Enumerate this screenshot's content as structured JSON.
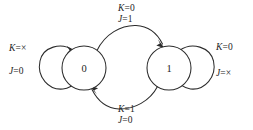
{
  "diagram": {
    "type": "state-transition-diagram",
    "title": "",
    "stroke_color": "#2b2b2b",
    "background_color": "#ffffff",
    "states": [
      {
        "id": "s0",
        "label": "0",
        "cx": 84,
        "cy": 68,
        "r": 22
      },
      {
        "id": "s1",
        "label": "1",
        "cx": 169,
        "cy": 68,
        "r": 22
      }
    ],
    "transitions": [
      {
        "id": "t-self-0",
        "from": "s0",
        "to": "s0",
        "kind": "self-loop",
        "side": "left",
        "label_lines": [
          {
            "var": "K",
            "eq": "=",
            "value": "×"
          },
          {
            "var": "J",
            "eq": "=",
            "value": "0"
          }
        ]
      },
      {
        "id": "t-0-to-1",
        "from": "s0",
        "to": "s1",
        "kind": "arc",
        "side": "top",
        "label_lines": [
          {
            "var": "K",
            "eq": "=",
            "value": "0"
          },
          {
            "var": "J",
            "eq": "=",
            "value": "1"
          }
        ]
      },
      {
        "id": "t-1-to-0",
        "from": "s1",
        "to": "s0",
        "kind": "arc",
        "side": "bottom",
        "label_lines": [
          {
            "var": "K",
            "eq": "=",
            "value": "1"
          },
          {
            "var": "J",
            "eq": "=",
            "value": "0"
          }
        ]
      },
      {
        "id": "t-self-1",
        "from": "s1",
        "to": "s1",
        "kind": "self-loop",
        "side": "right",
        "label_lines": [
          {
            "var": "K",
            "eq": "=",
            "value": "0"
          },
          {
            "var": "J",
            "eq": "=",
            "value": "×"
          }
        ]
      }
    ],
    "labels": {
      "left_top_var": "K",
      "left_top_eq": "=",
      "left_top_val": "×",
      "left_bottom_var": "J",
      "left_bottom_eq": "=",
      "left_bottom_val": "0",
      "top_first_var": "K",
      "top_first_eq": "=",
      "top_first_val": "0",
      "top_second_var": "J",
      "top_second_eq": "=",
      "top_second_val": "1",
      "bottom_first_var": "K",
      "bottom_first_eq": "=",
      "bottom_first_val": "1",
      "bottom_second_var": "J",
      "bottom_second_eq": "=",
      "bottom_second_val": "0",
      "right_top_var": "K",
      "right_top_eq": "=",
      "right_top_val": "0",
      "right_bottom_var": "J",
      "right_bottom_eq": "=",
      "right_bottom_val": "×",
      "state_zero": "0",
      "state_one": "1"
    }
  }
}
